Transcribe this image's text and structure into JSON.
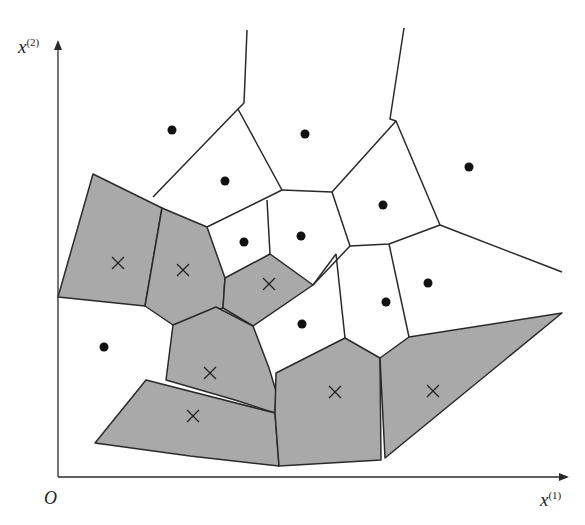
{
  "figure": {
    "type": "voronoi-diagram",
    "axes": {
      "origin_label": "O",
      "x_label": "x",
      "x_sup": "(1)",
      "y_label": "x",
      "y_sup": "(2)"
    },
    "colors": {
      "shaded_fill": "#a9a9a9",
      "line": "#2a2a2a",
      "background": "#ffffff"
    },
    "class_markers": {
      "dot": "positive class (filled circle)",
      "cross": "negative class (x mark, shaded region)"
    },
    "dots": [
      [
        172,
        130
      ],
      [
        305,
        134
      ],
      [
        469,
        167
      ],
      [
        225,
        181
      ],
      [
        383,
        205
      ],
      [
        244,
        242
      ],
      [
        301,
        236
      ],
      [
        428,
        283
      ],
      [
        386,
        302
      ],
      [
        302,
        324
      ],
      [
        104,
        347
      ]
    ],
    "crosses": [
      [
        118,
        263
      ],
      [
        183,
        270
      ],
      [
        269,
        284
      ],
      [
        210,
        373
      ],
      [
        193,
        416
      ],
      [
        335,
        392
      ],
      [
        433,
        391
      ]
    ]
  }
}
